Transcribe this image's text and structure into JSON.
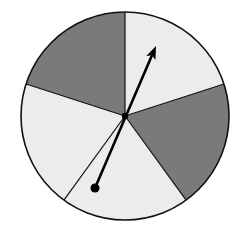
{
  "spinner": {
    "center": [
      125,
      116
    ],
    "radius": 104,
    "sections": [
      {
        "id": "top-right",
        "shade": "light",
        "color": "#ececec",
        "from": [
          125,
          12
        ],
        "to": [
          224,
          84
        ]
      },
      {
        "id": "right",
        "shade": "dark",
        "color": "#7a7a7a",
        "from": [
          224,
          84
        ],
        "to": [
          186,
          200
        ]
      },
      {
        "id": "bottom",
        "shade": "light",
        "color": "#ececec",
        "from": [
          186,
          200
        ],
        "to": [
          64,
          200
        ]
      },
      {
        "id": "left",
        "shade": "light",
        "color": "#ececec",
        "from": [
          64,
          200
        ],
        "to": [
          26,
          84
        ]
      },
      {
        "id": "top-left",
        "shade": "dark",
        "color": "#7a7a7a",
        "from": [
          26,
          84
        ],
        "to": [
          125,
          12
        ]
      }
    ],
    "arrow": {
      "tail": [
        95,
        188
      ],
      "tip": [
        156,
        46
      ]
    },
    "colors": {
      "light": "#ececec",
      "dark": "#7a7a7a",
      "outline": "#111111"
    }
  }
}
